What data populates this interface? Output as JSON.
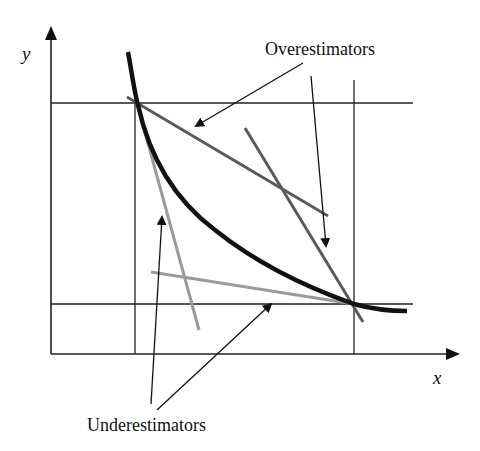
{
  "diagram": {
    "axes": {
      "x_label": "x",
      "y_label": "y"
    },
    "annotations": {
      "overestimators_label": "Overestimators",
      "underestimators_label": "Underestimators"
    },
    "colors": {
      "curve": "#111111",
      "axes": "#222222",
      "overestimator": "#5a5a5a",
      "underestimator": "#9a9a9a",
      "background": "#ffffff"
    }
  }
}
